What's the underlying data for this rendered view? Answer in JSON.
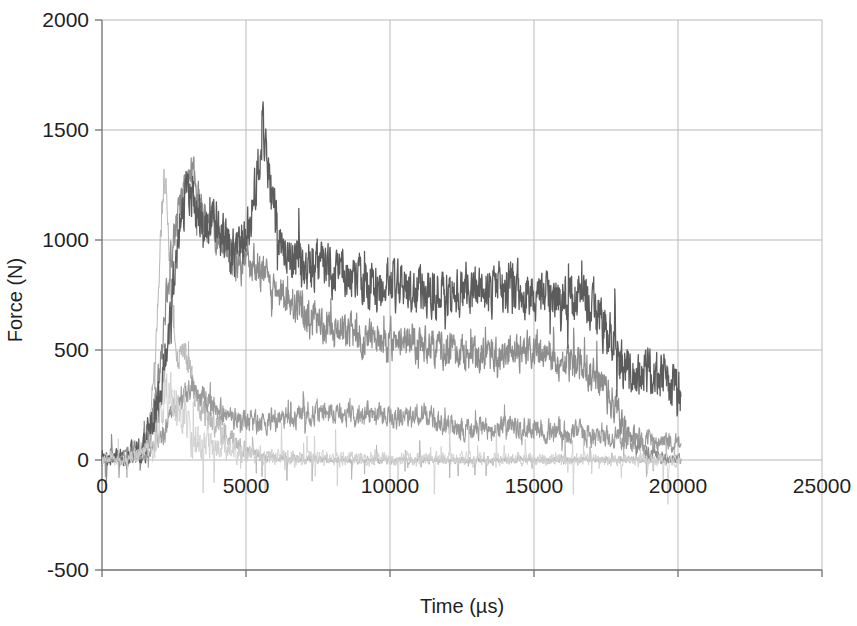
{
  "chart_data": {
    "type": "line",
    "title": "",
    "xlabel": "Time (µs)",
    "ylabel": "Force (N)",
    "xlim": [
      0,
      25000
    ],
    "ylim": [
      -500,
      2000
    ],
    "xticks": [
      0,
      5000,
      10000,
      15000,
      20000,
      25000
    ],
    "yticks": [
      -500,
      0,
      500,
      1000,
      1500,
      2000
    ],
    "xtick_labels": [
      "0",
      "5000",
      "10000",
      "15000",
      "20000",
      "25000"
    ],
    "ytick_labels": [
      "-500",
      "0",
      "500",
      "1000",
      "1500",
      "2000"
    ],
    "grid": true,
    "legend": "none",
    "series": [
      {
        "name": "trace-1-light-early-peak",
        "color": "#b7b7b7",
        "width": 1.0,
        "noise": 55,
        "seed": 11,
        "x": [
          0,
          400,
          900,
          1300,
          1700,
          1900,
          2050,
          2150,
          2250,
          2350,
          2500,
          2650,
          2800,
          3000,
          3300,
          3700,
          4200,
          4800,
          5400,
          6000,
          7000,
          8000,
          9000,
          10000,
          11000,
          12000,
          13000,
          14000,
          15000,
          16000,
          17000,
          18000,
          19000,
          20000,
          20100
        ],
        "y": [
          0,
          5,
          15,
          40,
          180,
          600,
          1050,
          1290,
          1180,
          900,
          560,
          420,
          520,
          430,
          260,
          190,
          120,
          60,
          20,
          10,
          5,
          0,
          0,
          0,
          0,
          0,
          0,
          0,
          0,
          0,
          0,
          0,
          0,
          0,
          0
        ]
      },
      {
        "name": "trace-2-mid-decay-plateau-500",
        "color": "#8e8e8e",
        "width": 1.2,
        "noise": 70,
        "seed": 29,
        "x": [
          0,
          500,
          1200,
          1700,
          2000,
          2300,
          2600,
          2900,
          3100,
          3300,
          3600,
          3900,
          4300,
          4700,
          5100,
          5600,
          6100,
          6700,
          7300,
          8000,
          8700,
          9400,
          10200,
          11000,
          11800,
          12600,
          13400,
          14200,
          15000,
          15600,
          16000,
          16300,
          16600,
          16900,
          17200,
          17600,
          18000,
          18400,
          18800,
          19200,
          19600,
          20000,
          20100
        ],
        "y": [
          0,
          10,
          30,
          120,
          420,
          820,
          1080,
          1240,
          1320,
          1210,
          1090,
          1050,
          960,
          880,
          900,
          840,
          780,
          700,
          640,
          600,
          580,
          560,
          545,
          530,
          505,
          480,
          470,
          490,
          500,
          470,
          440,
          430,
          420,
          400,
          380,
          300,
          180,
          90,
          40,
          20,
          10,
          5,
          0
        ]
      },
      {
        "name": "trace-3-dark-plateau-800",
        "color": "#5c5c5c",
        "width": 1.3,
        "noise": 95,
        "seed": 47,
        "x": [
          0,
          600,
          1400,
          2000,
          2400,
          2700,
          3000,
          3200,
          3500,
          3900,
          4300,
          4700,
          5100,
          5400,
          5600,
          5900,
          6300,
          6800,
          7400,
          8000,
          8700,
          9400,
          10200,
          11000,
          11800,
          12600,
          13400,
          14200,
          15000,
          15800,
          16400,
          16900,
          17200,
          17500,
          17800,
          18000,
          18200,
          18500,
          18900,
          19300,
          19700,
          20000,
          20100
        ],
        "y": [
          0,
          12,
          45,
          260,
          700,
          1050,
          1250,
          1150,
          1020,
          1100,
          980,
          930,
          1060,
          1320,
          1540,
          1150,
          980,
          900,
          880,
          860,
          830,
          800,
          790,
          780,
          770,
          775,
          780,
          770,
          760,
          750,
          740,
          720,
          680,
          600,
          500,
          430,
          400,
          400,
          395,
          380,
          350,
          300,
          280
        ]
      },
      {
        "name": "trace-4-low-plateau-200",
        "color": "#9a9a9a",
        "width": 1.1,
        "noise": 45,
        "seed": 67,
        "x": [
          0,
          700,
          1500,
          2100,
          2500,
          2800,
          3100,
          3400,
          3800,
          4300,
          4900,
          5500,
          6200,
          7000,
          7800,
          8600,
          9400,
          10200,
          11000,
          11400,
          11700,
          12000,
          12600,
          13400,
          14200,
          15000,
          15800,
          16500,
          17200,
          17900,
          18600,
          19300,
          20000,
          20100
        ],
        "y": [
          0,
          8,
          25,
          110,
          230,
          300,
          330,
          300,
          250,
          200,
          175,
          165,
          185,
          205,
          215,
          210,
          205,
          200,
          200,
          195,
          180,
          150,
          140,
          145,
          150,
          140,
          130,
          120,
          110,
          100,
          90,
          85,
          80,
          75
        ]
      },
      {
        "name": "trace-5-faint-noise-baseline",
        "color": "#cfcfcf",
        "width": 0.9,
        "noise": 90,
        "seed": 89,
        "x": [
          0,
          1000,
          1800,
          2200,
          2600,
          3000,
          3400,
          4000,
          5000,
          6000,
          7000,
          8000,
          9000,
          10000,
          11000,
          12000,
          13000,
          14000,
          15000,
          16000,
          17000,
          18000,
          19000,
          20000,
          20100
        ],
        "y": [
          0,
          5,
          60,
          330,
          240,
          150,
          90,
          50,
          25,
          15,
          10,
          8,
          6,
          5,
          5,
          5,
          4,
          4,
          3,
          3,
          2,
          2,
          2,
          0,
          0
        ]
      }
    ]
  },
  "plot_geometry": {
    "left_px": 102,
    "right_px": 822,
    "top_px": 20,
    "bottom_px": 570
  }
}
